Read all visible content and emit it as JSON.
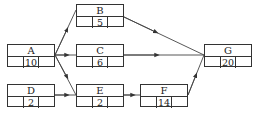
{
  "diagram": {
    "type": "activity-on-node network",
    "nodes": [
      {
        "id": "A",
        "label": "A",
        "duration": "10",
        "left": "",
        "right": ""
      },
      {
        "id": "B",
        "label": "B",
        "duration": "5",
        "left": "",
        "right": ""
      },
      {
        "id": "C",
        "label": "C",
        "duration": "6",
        "left": "",
        "right": ""
      },
      {
        "id": "D",
        "label": "D",
        "duration": "2",
        "left": "",
        "right": ""
      },
      {
        "id": "E",
        "label": "E",
        "duration": "2",
        "left": "",
        "right": ""
      },
      {
        "id": "F",
        "label": "F",
        "duration": "14",
        "left": "",
        "right": ""
      },
      {
        "id": "G",
        "label": "G",
        "duration": "20",
        "left": "",
        "right": ""
      }
    ],
    "edges": [
      {
        "from": "A",
        "to": "B"
      },
      {
        "from": "A",
        "to": "C"
      },
      {
        "from": "A",
        "to": "E"
      },
      {
        "from": "D",
        "to": "E"
      },
      {
        "from": "B",
        "to": "G"
      },
      {
        "from": "C",
        "to": "G"
      },
      {
        "from": "E",
        "to": "F"
      },
      {
        "from": "F",
        "to": "G"
      }
    ],
    "colors": {
      "line": "#333333",
      "background": "#ffffff"
    }
  }
}
